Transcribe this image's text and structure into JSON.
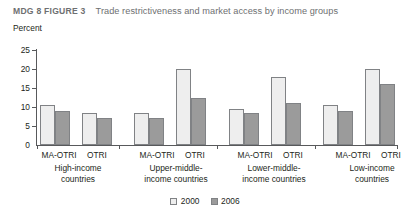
{
  "header": {
    "figure_number": "MDG 8 FIGURE 3",
    "title": "Trade restrictiveness and market access by income groups"
  },
  "chart_data": {
    "type": "bar",
    "title": "Trade restrictiveness and market access by income groups",
    "xlabel": "",
    "ylabel": "Percent",
    "ylim": [
      0,
      25
    ],
    "yticks": [
      0,
      5,
      10,
      15,
      20,
      25
    ],
    "ytick_labels": [
      "0",
      "5",
      "10",
      "15",
      "20",
      "25"
    ],
    "grid": false,
    "legend_position": "bottom-center",
    "series": [
      {
        "name": "2000",
        "color": "#eeeeee",
        "values": [
          10.5,
          8.5,
          8.5,
          20.0,
          9.5,
          18.0,
          10.5,
          20.0
        ]
      },
      {
        "name": "2006",
        "color": "#9b9b9b",
        "values": [
          9.0,
          7.0,
          7.0,
          12.5,
          8.5,
          11.0,
          9.0,
          16.0
        ]
      }
    ],
    "categories": [
      "MA-OTRI",
      "OTRI",
      "MA-OTRI",
      "OTRI",
      "MA-OTRI",
      "OTRI",
      "MA-OTRI",
      "OTRI"
    ],
    "groups": [
      {
        "label": "High-income countries",
        "label_lines": [
          "High-income",
          "countries"
        ],
        "indicators": [
          "MA-OTRI",
          "OTRI"
        ],
        "values_2000": [
          10.5,
          8.5
        ],
        "values_2006": [
          9.0,
          7.0
        ]
      },
      {
        "label": "Upper-middle-income countries",
        "label_lines": [
          "Upper-middle-",
          "income countries"
        ],
        "indicators": [
          "MA-OTRI",
          "OTRI"
        ],
        "values_2000": [
          8.5,
          20.0
        ],
        "values_2006": [
          7.0,
          12.5
        ]
      },
      {
        "label": "Lower-middle-income countries",
        "label_lines": [
          "Lower-middle-",
          "income countries"
        ],
        "indicators": [
          "MA-OTRI",
          "OTRI"
        ],
        "values_2000": [
          9.5,
          18.0
        ],
        "values_2006": [
          8.5,
          11.0
        ]
      },
      {
        "label": "Low-income countries",
        "label_lines": [
          "Low-income",
          "countries"
        ],
        "indicators": [
          "MA-OTRI",
          "OTRI"
        ],
        "values_2000": [
          10.5,
          20.0
        ],
        "values_2006": [
          9.0,
          16.0
        ]
      }
    ]
  },
  "axis": {
    "unit_label": "Percent",
    "ticks": [
      "25",
      "20",
      "15",
      "10",
      "5",
      "0"
    ]
  },
  "legend": {
    "items": [
      {
        "label": "2000",
        "color": "#eeeeee"
      },
      {
        "label": "2006",
        "color": "#9b9b9b"
      }
    ]
  },
  "colors": {
    "bar_2000": "#eeeeee",
    "bar_2006": "#9b9b9b",
    "bar_outline": "#808285",
    "axis": "#58595b",
    "header_text": "#6e6f71",
    "body_text": "#231f20"
  }
}
